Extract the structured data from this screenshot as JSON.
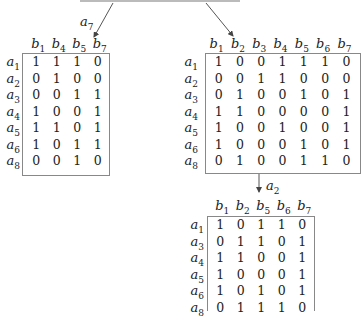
{
  "edges": [
    {
      "label_var": "a",
      "label_sub": "7"
    },
    {
      "label_var": "",
      "label_sub": ""
    },
    {
      "label_var": "a",
      "label_sub": "2"
    }
  ],
  "left_matrix": {
    "cols": [
      "1",
      "4",
      "5",
      "7"
    ],
    "rows": [
      "1",
      "2",
      "3",
      "4",
      "5",
      "6",
      "8"
    ],
    "values": [
      [
        "1",
        "1",
        "1",
        "0"
      ],
      [
        "0",
        "1",
        "0",
        "0"
      ],
      [
        "0",
        "0",
        "1",
        "1"
      ],
      [
        "1",
        "0",
        "0",
        "1"
      ],
      [
        "1",
        "1",
        "0",
        "1"
      ],
      [
        "1",
        "0",
        "1",
        "1"
      ],
      [
        "0",
        "0",
        "1",
        "0"
      ]
    ]
  },
  "right_matrix": {
    "cols": [
      "1",
      "2",
      "3",
      "4",
      "5",
      "6",
      "7"
    ],
    "rows": [
      "1",
      "2",
      "3",
      "4",
      "5",
      "6",
      "8"
    ],
    "values": [
      [
        "1",
        "0",
        "0",
        "1",
        "1",
        "1",
        "0"
      ],
      [
        "0",
        "0",
        "1",
        "1",
        "0",
        "0",
        "0"
      ],
      [
        "0",
        "1",
        "0",
        "0",
        "1",
        "0",
        "1"
      ],
      [
        "1",
        "1",
        "0",
        "0",
        "0",
        "0",
        "1"
      ],
      [
        "1",
        "0",
        "0",
        "1",
        "0",
        "0",
        "1"
      ],
      [
        "1",
        "0",
        "0",
        "0",
        "1",
        "0",
        "1"
      ],
      [
        "0",
        "1",
        "0",
        "0",
        "1",
        "1",
        "0"
      ]
    ]
  },
  "bottom_matrix": {
    "cols": [
      "1",
      "2",
      "5",
      "6",
      "7"
    ],
    "rows": [
      "1",
      "3",
      "4",
      "5",
      "6",
      "8"
    ],
    "values": [
      [
        "1",
        "0",
        "1",
        "1",
        "0"
      ],
      [
        "0",
        "1",
        "1",
        "0",
        "1"
      ],
      [
        "1",
        "1",
        "0",
        "0",
        "1"
      ],
      [
        "1",
        "0",
        "0",
        "0",
        "1"
      ],
      [
        "1",
        "0",
        "1",
        "0",
        "1"
      ],
      [
        "0",
        "1",
        "1",
        "1",
        "0"
      ]
    ]
  }
}
